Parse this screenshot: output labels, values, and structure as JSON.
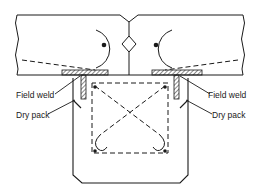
{
  "diagram": {
    "type": "structural connection detail",
    "labels": {
      "field_weld_left": "Field weld",
      "dry_pack_left": "Dry pack",
      "field_weld_right": "Field weld",
      "dry_pack_right": "Dry pack"
    },
    "colors": {
      "line": "#1a1a1a",
      "background": "#ffffff"
    }
  }
}
